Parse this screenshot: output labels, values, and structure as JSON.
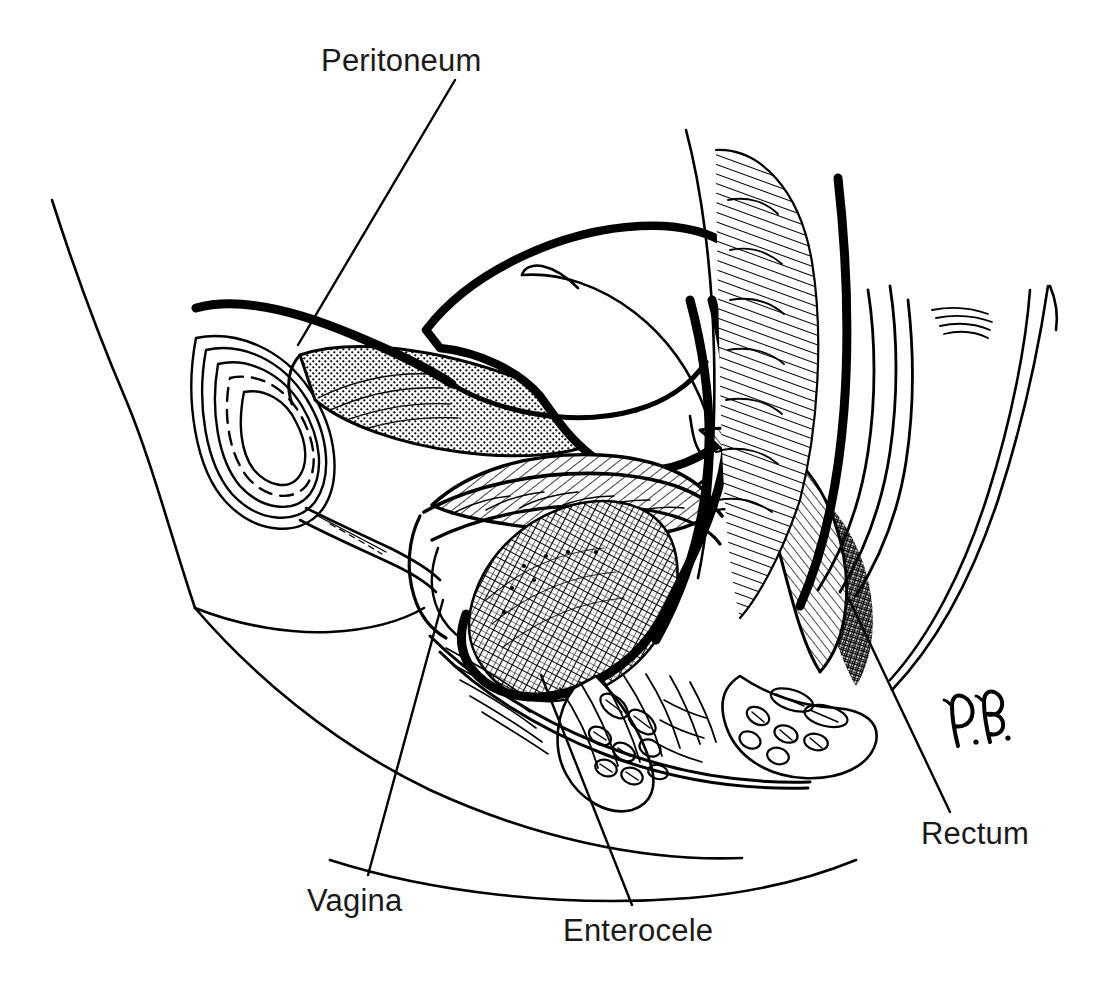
{
  "figure": {
    "type": "medical-line-illustration",
    "view": "midsagittal section of the female pelvis",
    "background_color": "#ffffff",
    "ink_color": "#000000",
    "label_color": "#1a1a1a"
  },
  "labels": {
    "peritoneum": "Peritoneum",
    "vagina": "Vagina",
    "enterocele": "Enterocele",
    "rectum": "Rectum"
  },
  "signature": {
    "text": "P. B.",
    "style": "cursive-initials",
    "position": "lower-right"
  },
  "leader_lines": [
    {
      "name": "peritoneum-leader",
      "from": [
        455,
        80
      ],
      "to": [
        298,
        345
      ]
    },
    {
      "name": "vagina-leader",
      "from": [
        443,
        600
      ],
      "to": [
        368,
        875
      ]
    },
    {
      "name": "enterocele-leader",
      "from": [
        541,
        675
      ],
      "to": [
        632,
        905
      ]
    },
    {
      "name": "rectum-leader",
      "from": [
        848,
        597
      ],
      "to": [
        950,
        812
      ]
    }
  ],
  "structures": [
    {
      "name": "abdominal-wall-contour",
      "style": "thin-outline"
    },
    {
      "name": "pubic-symphysis",
      "style": "concentric-ovals"
    },
    {
      "name": "bladder",
      "style": "stippled-interior"
    },
    {
      "name": "urethra",
      "style": "tubular-outline"
    },
    {
      "name": "uterus",
      "style": "bold-outline"
    },
    {
      "name": "endometrial-cavity",
      "style": "thin-inner-line"
    },
    {
      "name": "peritoneum",
      "style": "bold-continuous-line"
    },
    {
      "name": "enterocele-sac",
      "style": "cross-hatched"
    },
    {
      "name": "vagina",
      "style": "rugae-hatching"
    },
    {
      "name": "rectum",
      "style": "bold-wall-hatching"
    },
    {
      "name": "sacrum-coccyx",
      "style": "dense-hatching"
    },
    {
      "name": "levator-ani-muscle",
      "style": "cross-sectioned-bundles"
    },
    {
      "name": "anal-canal",
      "style": "tubular-outline"
    },
    {
      "name": "buttock-contour",
      "style": "thin-outline"
    },
    {
      "name": "perineal-body",
      "style": "radiating-hatching"
    }
  ]
}
